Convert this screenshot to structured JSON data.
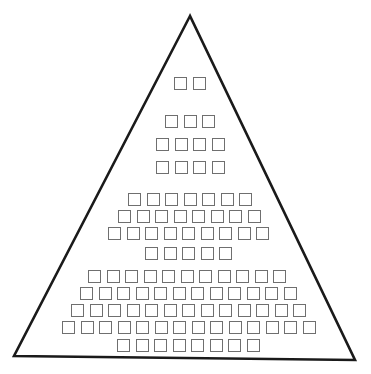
{
  "diagram": {
    "type": "pyramid-of-squares",
    "triangle": {
      "apex": [
        190,
        16
      ],
      "base_left": [
        14,
        356
      ],
      "base_right": [
        355,
        360
      ],
      "stroke": "#1a1a1a",
      "stroke_width": 2.6
    },
    "square": {
      "size": 13,
      "pitch": 18.5,
      "stroke": "#6f6f6f"
    },
    "groups": [
      {
        "name": "tier-1",
        "rows": [
          {
            "count": 2,
            "x": 174,
            "y": 77
          }
        ]
      },
      {
        "name": "tier-2",
        "rows": [
          {
            "count": 3,
            "x": 165,
            "y": 115
          },
          {
            "count": 4,
            "x": 156,
            "y": 138
          },
          {
            "count": 4,
            "x": 156,
            "y": 161
          }
        ]
      },
      {
        "name": "tier-3",
        "rows": [
          {
            "count": 7,
            "x": 128,
            "y": 193
          },
          {
            "count": 8,
            "x": 118,
            "y": 210
          },
          {
            "count": 9,
            "x": 108,
            "y": 227
          },
          {
            "count": 5,
            "x": 145,
            "y": 247
          }
        ]
      },
      {
        "name": "tier-4",
        "rows": [
          {
            "count": 11,
            "x": 88,
            "y": 270
          },
          {
            "count": 12,
            "x": 80,
            "y": 287
          },
          {
            "count": 13,
            "x": 71,
            "y": 304
          },
          {
            "count": 14,
            "x": 62,
            "y": 321
          },
          {
            "count": 8,
            "x": 117,
            "y": 339
          }
        ]
      }
    ],
    "total_squares": 100
  }
}
